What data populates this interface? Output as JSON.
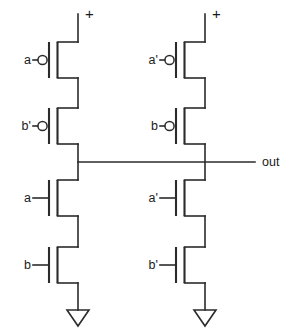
{
  "diagram": {
    "type": "circuit-schematic",
    "width": 295,
    "height": 336,
    "line_color": "#2b2b2b",
    "background_color": "#ffffff",
    "text_color": "#1a1a1a"
  },
  "power": {
    "left_symbol": "+",
    "right_symbol": "+"
  },
  "output": {
    "label": "out"
  },
  "branches": {
    "left": {
      "pmos": [
        {
          "label": "a",
          "type": "pmos",
          "inverted_gate": true
        },
        {
          "label": "b'",
          "type": "pmos",
          "inverted_gate": true
        }
      ],
      "nmos": [
        {
          "label": "a",
          "type": "nmos",
          "inverted_gate": false
        },
        {
          "label": "b",
          "type": "nmos",
          "inverted_gate": false
        }
      ],
      "ground": "gnd-triangle"
    },
    "right": {
      "pmos": [
        {
          "label": "a'",
          "type": "pmos",
          "inverted_gate": true
        },
        {
          "label": "b",
          "type": "pmos",
          "inverted_gate": true
        }
      ],
      "nmos": [
        {
          "label": "a'",
          "type": "nmos",
          "inverted_gate": false
        },
        {
          "label": "b'",
          "type": "nmos",
          "inverted_gate": false
        }
      ],
      "ground": "gnd-triangle"
    }
  },
  "labels": {
    "l_p1": "a",
    "l_p2": "b'",
    "l_n1": "a",
    "l_n2": "b",
    "r_p1": "a'",
    "r_p2": "b",
    "r_n1": "a'",
    "r_n2": "b'",
    "out": "out",
    "plus_left": "+",
    "plus_right": "+"
  }
}
